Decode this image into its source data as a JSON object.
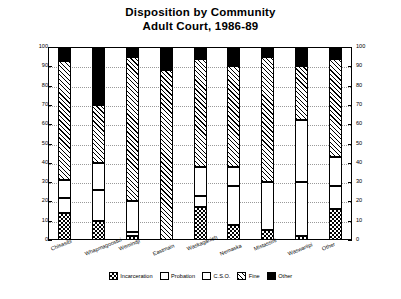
{
  "chart_data": {
    "type": "bar",
    "subtype": "stacked-bar-100",
    "title": "Disposition by Community",
    "subtitle": "Adult Court, 1986-89",
    "xlabel": "",
    "ylabel": "Percent",
    "ylim": [
      0,
      100
    ],
    "ytick_step": 10,
    "yticks": [
      0,
      10,
      20,
      30,
      40,
      50,
      60,
      70,
      80,
      90,
      100
    ],
    "grid": true,
    "dual_y_axis": true,
    "legend_position": "bottom",
    "categories": [
      "Chisasibi",
      "Whapmagoostui",
      "Wemindji",
      "Eastmain",
      "Waskaganish",
      "Nemaska",
      "Mistassini",
      "Waswanipi",
      "Other"
    ],
    "series": [
      {
        "name": "Incarceration",
        "pattern": "checkerboard",
        "values": [
          14,
          10,
          2,
          0,
          17,
          8,
          5,
          2,
          16
        ]
      },
      {
        "name": "Probation",
        "pattern": "dotted-gray",
        "values": [
          8,
          16,
          2,
          0,
          6,
          20,
          25,
          28,
          12
        ]
      },
      {
        "name": "C.S.O.",
        "pattern": "white",
        "values": [
          9,
          14,
          16,
          0,
          15,
          10,
          0,
          32,
          15
        ]
      },
      {
        "name": "Fine",
        "pattern": "diagonal-hatch",
        "values": [
          62,
          30,
          75,
          88,
          56,
          52,
          65,
          28,
          51
        ]
      },
      {
        "name": "Other",
        "pattern": "solid-black",
        "values": [
          7,
          30,
          5,
          12,
          6,
          10,
          5,
          10,
          6
        ]
      }
    ]
  },
  "legend": {
    "items": [
      {
        "label": "Incarceration",
        "pattern": "checkerboard"
      },
      {
        "label": "Probation",
        "pattern": "dotted-gray"
      },
      {
        "label": "C.S.O.",
        "pattern": "white"
      },
      {
        "label": "Fine",
        "pattern": "diagonal-hatch"
      },
      {
        "label": "Other",
        "pattern": "solid-black"
      }
    ]
  },
  "colors": {
    "ink": "#000000",
    "background": "#ffffff",
    "gridline": "#9a9a9a"
  }
}
